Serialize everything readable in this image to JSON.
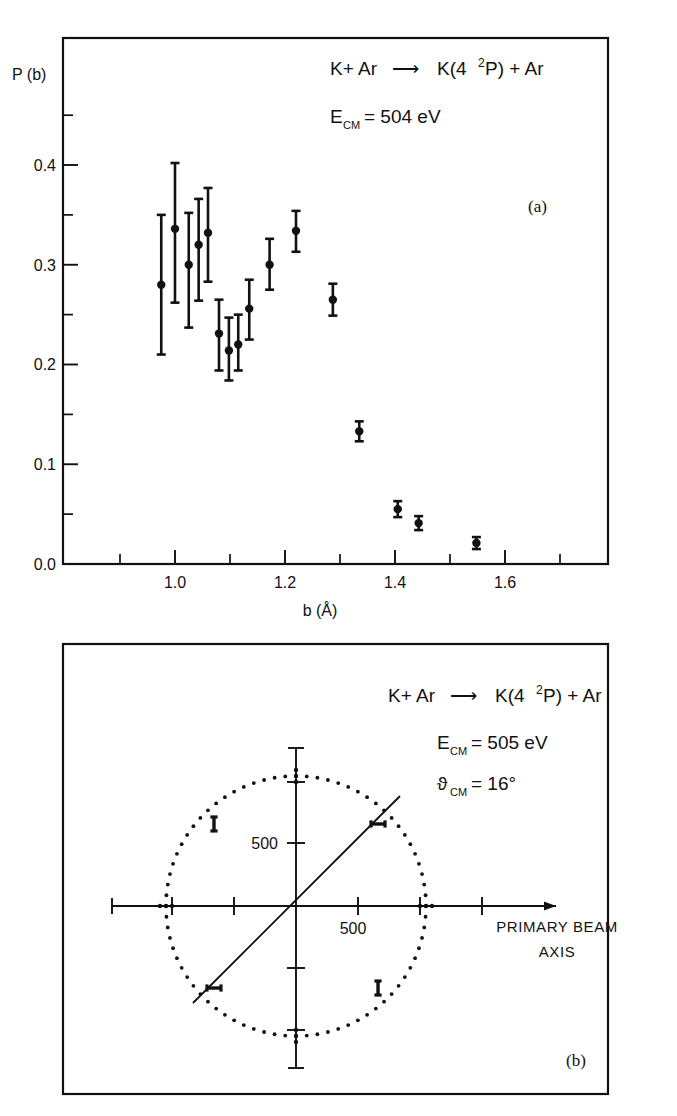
{
  "figure": {
    "panel_a_label": "(a)",
    "panel_b_label": "(b)"
  },
  "panel_a": {
    "ylabel": "P (b)",
    "xlabel": "b (Å)",
    "reaction_pre": "K+ Ar",
    "reaction_arrow": "⟶",
    "reaction_post_a": "K(4",
    "reaction_post_sup": "2",
    "reaction_post_b": "P) + Ar",
    "energy_symbol": "E",
    "energy_sub": "CM",
    "energy_value": " = 504 eV",
    "y_ticks": [
      "0.0",
      "0.1",
      "0.2",
      "0.3",
      "0.4"
    ],
    "x_ticks": [
      "1.0",
      "1.2",
      "1.4",
      "1.6"
    ]
  },
  "panel_b": {
    "reaction_pre": "K+ Ar",
    "reaction_arrow": "⟶",
    "reaction_post_a": "K(4",
    "reaction_post_sup": "2",
    "reaction_post_b": "P) + Ar",
    "energy_symbol": "E",
    "energy_sub": "CM",
    "energy_value": " = 505 eV",
    "angle_symbol": "ϑ",
    "angle_sub": "CM",
    "angle_value": " = 16°",
    "x_tick_label": "500",
    "y_tick_label": "500",
    "beam_label_line1": "PRIMARY BEAM",
    "beam_label_line2": "AXIS"
  },
  "chart_data": [
    {
      "type": "scatter",
      "title": "K + Ar ⟶ K(4²P) + Ar,  E_CM = 504 eV",
      "xlabel": "b (Å)",
      "ylabel": "P (b)",
      "xlim": [
        0.84,
        1.7
      ],
      "ylim": [
        0.0,
        0.46
      ],
      "grid": false,
      "legend": "none",
      "x_ticks": [
        1.0,
        1.2,
        1.4,
        1.6
      ],
      "y_ticks": [
        0.0,
        0.1,
        0.2,
        0.3,
        0.4
      ],
      "x_minor_step": 0.05,
      "y_minor_step": 0.05,
      "points": [
        {
          "x": 0.975,
          "y": 0.28,
          "yerr_lo": 0.07,
          "yerr_hi": 0.07
        },
        {
          "x": 1.0,
          "y": 0.336,
          "yerr_lo": 0.074,
          "yerr_hi": 0.066
        },
        {
          "x": 1.025,
          "y": 0.3,
          "yerr_lo": 0.063,
          "yerr_hi": 0.052
        },
        {
          "x": 1.043,
          "y": 0.32,
          "yerr_lo": 0.056,
          "yerr_hi": 0.046
        },
        {
          "x": 1.06,
          "y": 0.332,
          "yerr_lo": 0.049,
          "yerr_hi": 0.045
        },
        {
          "x": 1.08,
          "y": 0.231,
          "yerr_lo": 0.037,
          "yerr_hi": 0.034
        },
        {
          "x": 1.098,
          "y": 0.214,
          "yerr_lo": 0.03,
          "yerr_hi": 0.033
        },
        {
          "x": 1.115,
          "y": 0.22,
          "yerr_lo": 0.026,
          "yerr_hi": 0.03
        },
        {
          "x": 1.135,
          "y": 0.256,
          "yerr_lo": 0.031,
          "yerr_hi": 0.029
        },
        {
          "x": 1.172,
          "y": 0.3,
          "yerr_lo": 0.025,
          "yerr_hi": 0.026
        },
        {
          "x": 1.22,
          "y": 0.334,
          "yerr_lo": 0.021,
          "yerr_hi": 0.02
        },
        {
          "x": 1.287,
          "y": 0.265,
          "yerr_lo": 0.016,
          "yerr_hi": 0.016
        },
        {
          "x": 1.335,
          "y": 0.133,
          "yerr_lo": 0.01,
          "yerr_hi": 0.01
        },
        {
          "x": 1.405,
          "y": 0.055,
          "yerr_lo": 0.008,
          "yerr_hi": 0.008
        },
        {
          "x": 1.443,
          "y": 0.041,
          "yerr_lo": 0.007,
          "yerr_hi": 0.007
        },
        {
          "x": 1.548,
          "y": 0.021,
          "yerr_lo": 0.006,
          "yerr_hi": 0.006
        }
      ]
    },
    {
      "type": "scatter",
      "subtype": "polar-newton-diagram",
      "title": "K + Ar ⟶ K(4²P) + Ar,  E_CM = 505 eV,  ϑ_CM = 16°",
      "xlabel": "PRIMARY BEAM AXIS",
      "axis_unit_label": "500",
      "axis_tick_value": 500,
      "circle_radius_units": 1000,
      "recoil_line_angle_deg": 45,
      "x_axis_ticks": [
        -1500,
        -1000,
        -500,
        500,
        1000,
        1500
      ],
      "y_axis_ticks": [
        -1500,
        -1000,
        -500,
        500,
        1000,
        1500
      ],
      "marker_angles_deg": [
        45,
        135,
        225,
        315
      ],
      "note": "dotted circle of constant CM speed with four error-bar markers"
    }
  ]
}
